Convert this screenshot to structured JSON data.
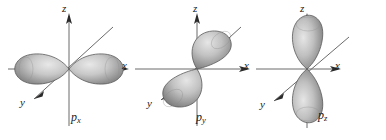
{
  "figure": {
    "background_color": "#ffffff",
    "width": 386,
    "height": 140,
    "orbital_fill_light": "#d8d8d8",
    "orbital_fill_dark": "#8a8a8a",
    "orbital_outline": "#4a4a4a",
    "axis_color": "#5a5a5a",
    "text_color": "#1a1a1a"
  },
  "panels": [
    {
      "id": "px",
      "label": "p",
      "label_sub": "x",
      "lobe_orientation": "horizontal-along-x",
      "axes": [
        {
          "name": "z",
          "label": "z",
          "direction": "up"
        },
        {
          "name": "x",
          "label": "x",
          "direction": "right"
        },
        {
          "name": "y",
          "label": "y",
          "direction": "down-left"
        }
      ]
    },
    {
      "id": "py",
      "label": "p",
      "label_sub": "y",
      "lobe_orientation": "along-y-diagonal",
      "axes": [
        {
          "name": "z",
          "label": "z",
          "direction": "up"
        },
        {
          "name": "x",
          "label": "x",
          "direction": "right"
        },
        {
          "name": "y",
          "label": "y",
          "direction": "down-left"
        }
      ]
    },
    {
      "id": "pz",
      "label": "p",
      "label_sub": "z",
      "lobe_orientation": "vertical-along-z",
      "axes": [
        {
          "name": "z",
          "label": "z",
          "direction": "up"
        },
        {
          "name": "x",
          "label": "x",
          "direction": "right"
        },
        {
          "name": "y",
          "label": "y",
          "direction": "down-left"
        }
      ]
    }
  ],
  "axis_labels": {
    "px_z": "z",
    "px_x": "x",
    "px_y": "y",
    "py_z": "z",
    "py_x": "x",
    "py_y": "y",
    "py_left_x": "x",
    "pz_z": "z",
    "pz_x": "x",
    "pz_y": "y",
    "pz_left_x": "x"
  }
}
